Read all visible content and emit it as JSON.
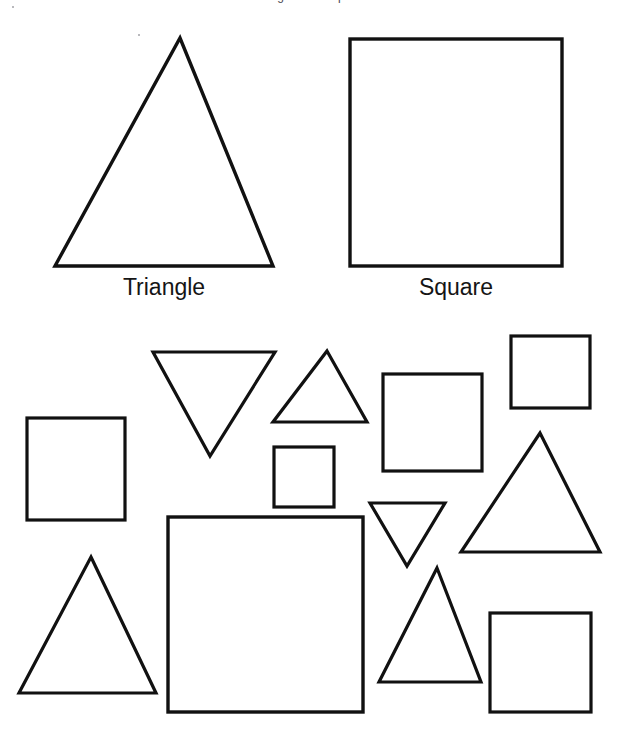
{
  "document": {
    "kind": "shape-sorting-worksheet",
    "title_partial": "Triangles and Squares",
    "background_color": "#ffffff",
    "stroke_color": "#111111",
    "width": 621,
    "height": 736
  },
  "key": {
    "triangle_label": "Triangle",
    "square_label": "Square"
  },
  "legend_shapes": [
    {
      "id": "key-triangle",
      "type": "triangle",
      "orientation": "up",
      "points": "180,38 273,266 55,266",
      "stroke_width": 3.4
    },
    {
      "id": "key-square",
      "type": "square",
      "x": 350,
      "y": 39,
      "width": 212,
      "height": 227,
      "stroke_width": 3.4
    }
  ],
  "sorting_shapes": [
    {
      "id": "shape-1",
      "type": "triangle",
      "orientation": "down",
      "points": "153,352 275,352 210,456",
      "stroke_width": 3.2
    },
    {
      "id": "shape-2",
      "type": "triangle",
      "orientation": "up",
      "points": "327,351 367,422 273,422",
      "stroke_width": 3.2
    },
    {
      "id": "shape-3",
      "type": "square",
      "x": 511,
      "y": 336,
      "width": 79,
      "height": 72,
      "stroke_width": 3.2
    },
    {
      "id": "shape-4",
      "type": "square",
      "x": 383,
      "y": 374,
      "width": 99,
      "height": 97,
      "stroke_width": 3.2
    },
    {
      "id": "shape-5",
      "type": "square",
      "x": 27,
      "y": 418,
      "width": 98,
      "height": 102,
      "stroke_width": 3.2
    },
    {
      "id": "shape-6",
      "type": "square",
      "x": 274,
      "y": 447,
      "width": 60,
      "height": 60,
      "stroke_width": 3.2
    },
    {
      "id": "shape-7",
      "type": "triangle",
      "orientation": "up",
      "points": "540,433 600,552 461,552",
      "stroke_width": 3.2
    },
    {
      "id": "shape-8",
      "type": "triangle",
      "orientation": "down",
      "points": "370,503 445,503 407,566",
      "stroke_width": 3.2
    },
    {
      "id": "shape-9",
      "type": "square",
      "x": 168,
      "y": 517,
      "width": 195,
      "height": 195,
      "stroke_width": 3.4
    },
    {
      "id": "shape-10",
      "type": "triangle",
      "orientation": "up",
      "points": "91,557 156,693 19,693",
      "stroke_width": 3.2
    },
    {
      "id": "shape-11",
      "type": "triangle",
      "orientation": "up",
      "points": "437,568 481,682 379,682",
      "stroke_width": 3.2
    },
    {
      "id": "shape-12",
      "type": "square",
      "x": 490,
      "y": 613,
      "width": 101,
      "height": 99,
      "stroke_width": 3.2
    }
  ],
  "counts": {
    "triangles": 6,
    "squares": 6,
    "total": 12
  }
}
